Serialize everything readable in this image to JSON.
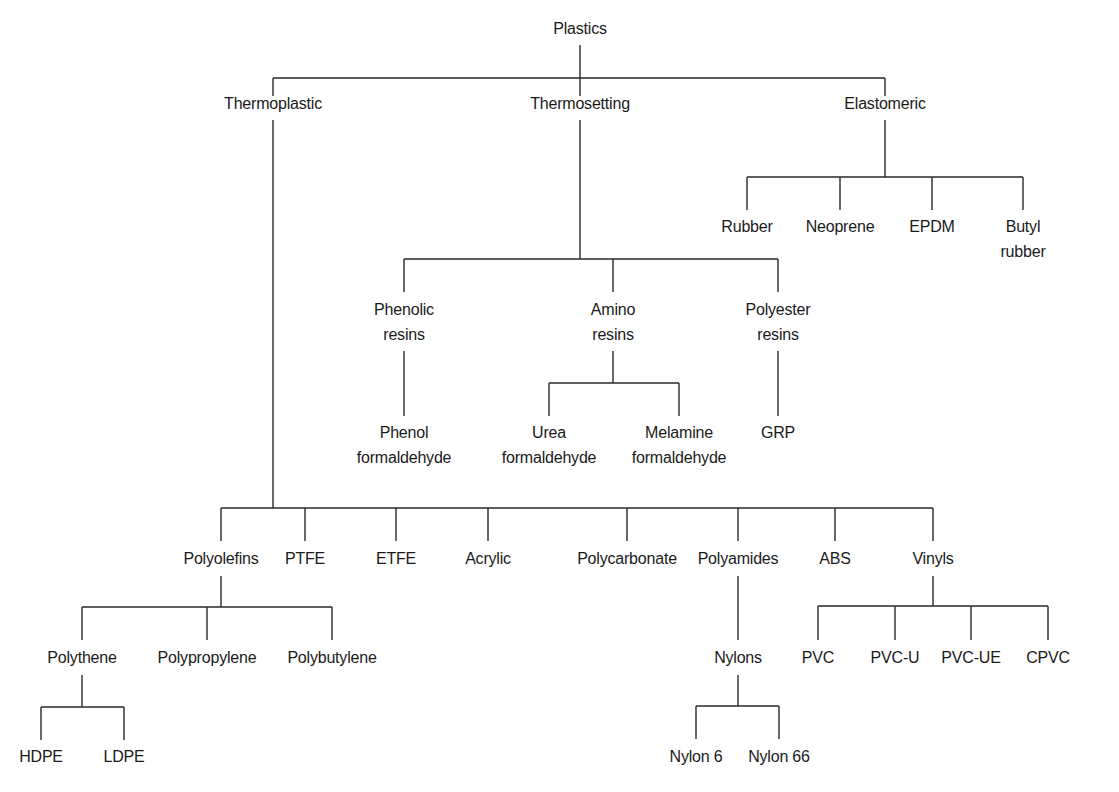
{
  "title": "Plastics",
  "nodes": {
    "plastics": {
      "label": "Plastics"
    },
    "thermoplastic": {
      "label": "Thermoplastic"
    },
    "thermosetting": {
      "label": "Thermosetting"
    },
    "elastomeric": {
      "label": "Elastomeric"
    },
    "rubber": {
      "label": "Rubber"
    },
    "neoprene": {
      "label": "Neoprene"
    },
    "epdm": {
      "label": "EPDM"
    },
    "butyl_rubber": {
      "line1": "Butyl",
      "line2": "rubber"
    },
    "phenolic_resins": {
      "line1": "Phenolic",
      "line2": "resins"
    },
    "amino_resins": {
      "line1": "Amino",
      "line2": "resins"
    },
    "polyester_resins": {
      "line1": "Polyester",
      "line2": "resins"
    },
    "phenol_formaldehyde": {
      "line1": "Phenol",
      "line2": "formaldehyde"
    },
    "urea_formaldehyde": {
      "line1": "Urea",
      "line2": "formaldehyde"
    },
    "melamine_formaldehyde": {
      "line1": "Melamine",
      "line2": "formaldehyde"
    },
    "grp": {
      "label": "GRP"
    },
    "polyolefins": {
      "label": "Polyolefins"
    },
    "ptfe": {
      "label": "PTFE"
    },
    "etfe": {
      "label": "ETFE"
    },
    "acrylic": {
      "label": "Acrylic"
    },
    "polycarbonate": {
      "label": "Polycarbonate"
    },
    "polyamides": {
      "label": "Polyamides"
    },
    "abs": {
      "label": "ABS"
    },
    "vinyls": {
      "label": "Vinyls"
    },
    "polythene": {
      "label": "Polythene"
    },
    "polypropylene": {
      "label": "Polypropylene"
    },
    "polybutylene": {
      "label": "Polybutylene"
    },
    "hdpe": {
      "label": "HDPE"
    },
    "ldpe": {
      "label": "LDPE"
    },
    "nylons": {
      "label": "Nylons"
    },
    "nylon_6": {
      "label": "Nylon 6"
    },
    "nylon_66": {
      "label": "Nylon 66"
    },
    "pvc": {
      "label": "PVC"
    },
    "pvc_u": {
      "label": "PVC-U"
    },
    "pvc_ue": {
      "label": "PVC-UE"
    },
    "cpvc": {
      "label": "CPVC"
    }
  },
  "tree": {
    "Plastics": [
      "Thermoplastic",
      "Thermosetting",
      "Elastomeric"
    ],
    "Thermoplastic": [
      "Polyolefins",
      "PTFE",
      "ETFE",
      "Acrylic",
      "Polycarbonate",
      "Polyamides",
      "ABS",
      "Vinyls"
    ],
    "Thermosetting": [
      "Phenolic resins",
      "Amino resins",
      "Polyester resins"
    ],
    "Elastomeric": [
      "Rubber",
      "Neoprene",
      "EPDM",
      "Butyl rubber"
    ],
    "Phenolic resins": [
      "Phenol formaldehyde"
    ],
    "Amino resins": [
      "Urea formaldehyde",
      "Melamine formaldehyde"
    ],
    "Polyester resins": [
      "GRP"
    ],
    "Polyolefins": [
      "Polythene",
      "Polypropylene",
      "Polybutylene"
    ],
    "Polythene": [
      "HDPE",
      "LDPE"
    ],
    "Polyamides": [
      "Nylons"
    ],
    "Nylons": [
      "Nylon 6",
      "Nylon 66"
    ],
    "Vinyls": [
      "PVC",
      "PVC-U",
      "PVC-UE",
      "CPVC"
    ]
  },
  "colors": {
    "line": "#2a2a2a",
    "text": "#1a1a1a",
    "background": "#ffffff"
  }
}
